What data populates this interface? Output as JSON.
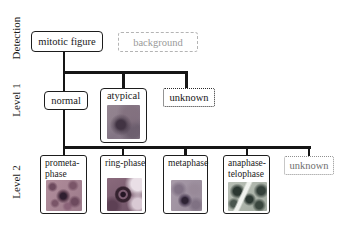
{
  "row_labels": {
    "detection": "Detection",
    "level1": "Level 1",
    "level2": "Level 2"
  },
  "nodes": {
    "mitotic_figure": {
      "label": "mitotic figure",
      "style": "solid"
    },
    "background": {
      "label": "background",
      "style": "dashed-gray"
    },
    "normal": {
      "label": "normal",
      "style": "solid"
    },
    "atypical": {
      "label": "atypical",
      "style": "solid",
      "thumbnail": "atypical-histology-thumbnail"
    },
    "unknown_level1": {
      "label": "unknown",
      "style": "dotted-black"
    },
    "prometaphase": {
      "label": "prometa-phase",
      "style": "solid",
      "thumbnail": "prometaphase-histology-thumbnail"
    },
    "ring_phase": {
      "label": "ring-phase",
      "style": "solid",
      "thumbnail": "ring-phase-histology-thumbnail"
    },
    "metaphase": {
      "label": "metaphase",
      "style": "solid",
      "thumbnail": "metaphase-histology-thumbnail"
    },
    "anaphase_telophase": {
      "label": "anaphase-telophase",
      "style": "solid",
      "thumbnail": "anaphase-telophase-histology-thumbnail"
    },
    "unknown_level2": {
      "label": "unknown",
      "style": "dotted-gray"
    }
  },
  "colors": {
    "line": "#151515",
    "solid_border": "#1d1d1d",
    "dashed_gray_border": "#b4b4b4",
    "muted_text": "#9a9a9a",
    "dotted_black_border": "#2a2a2a",
    "dotted_gray_border": "#8f8f8f",
    "dotted_gray_text": "#6f6f6f"
  }
}
